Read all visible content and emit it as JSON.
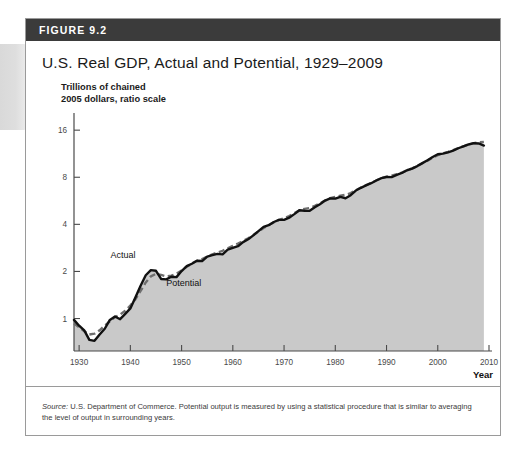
{
  "figure": {
    "number_label": "FIGURE 9.2",
    "title": "U.S. Real GDP, Actual and Potential, 1929–2009",
    "unit_caption_line1": "Trillions of chained",
    "unit_caption_line2": "2005 dollars, ratio scale",
    "source_prefix": "Source:",
    "source_text": " U.S. Department of Commerce. Potential output is measured by using a statistical procedure that is similar to averaging the level of output in surrounding years."
  },
  "colors": {
    "header_bar": "#3b3b3b",
    "actual_line": "#111111",
    "potential_line": "#6e6e6e",
    "area_fill": "#c9c9c9",
    "axis": "#4a4a4a",
    "border": "#9a9a9a"
  },
  "chart_data": {
    "type": "line",
    "title": "U.S. Real GDP, Actual and Potential, 1929–2009",
    "xlabel": "Year",
    "ylabel": "Trillions of chained 2005 dollars, ratio scale",
    "yscale": "log",
    "ylim": [
      0.62,
      20
    ],
    "xlim": [
      1929,
      2010
    ],
    "ytick_values": [
      1,
      2,
      4,
      8,
      16
    ],
    "ytick_labels": [
      "1",
      "2",
      "4",
      "8",
      "16"
    ],
    "xtick_values": [
      1930,
      1940,
      1950,
      1960,
      1970,
      1980,
      1990,
      2000,
      2010
    ],
    "xtick_labels": [
      "1930",
      "1940",
      "1950",
      "1960",
      "1970",
      "1980",
      "1990",
      "2000",
      "2010"
    ],
    "grid": false,
    "legend": "inline-annotations",
    "annotations": [
      {
        "text": "Actual",
        "x": 1941,
        "y": 2.45
      },
      {
        "text": "Potential",
        "x": 1947,
        "y": 1.62
      }
    ],
    "series": [
      {
        "name": "Actual",
        "style": "solid",
        "x": [
          1929,
          1930,
          1931,
          1932,
          1933,
          1934,
          1935,
          1936,
          1937,
          1938,
          1939,
          1940,
          1941,
          1942,
          1943,
          1944,
          1945,
          1946,
          1947,
          1948,
          1949,
          1950,
          1951,
          1952,
          1953,
          1954,
          1955,
          1956,
          1957,
          1958,
          1959,
          1960,
          1961,
          1962,
          1963,
          1964,
          1965,
          1966,
          1967,
          1968,
          1969,
          1970,
          1971,
          1972,
          1973,
          1974,
          1975,
          1976,
          1977,
          1978,
          1979,
          1980,
          1981,
          1982,
          1983,
          1984,
          1985,
          1986,
          1987,
          1988,
          1989,
          1990,
          1991,
          1992,
          1993,
          1994,
          1995,
          1996,
          1997,
          1998,
          1999,
          2000,
          2001,
          2002,
          2003,
          2004,
          2005,
          2006,
          2007,
          2008,
          2009
        ],
        "y": [
          0.98,
          0.9,
          0.84,
          0.73,
          0.72,
          0.79,
          0.86,
          0.98,
          1.03,
          0.99,
          1.07,
          1.16,
          1.37,
          1.62,
          1.89,
          2.04,
          2.02,
          1.79,
          1.78,
          1.85,
          1.84,
          2.01,
          2.16,
          2.24,
          2.34,
          2.33,
          2.49,
          2.54,
          2.59,
          2.57,
          2.76,
          2.83,
          2.9,
          3.08,
          3.21,
          3.4,
          3.62,
          3.85,
          3.95,
          4.14,
          4.27,
          4.27,
          4.41,
          4.65,
          4.92,
          4.89,
          4.88,
          5.14,
          5.38,
          5.68,
          5.86,
          5.84,
          5.99,
          5.87,
          6.14,
          6.58,
          6.85,
          7.09,
          7.33,
          7.63,
          7.9,
          8.03,
          8.02,
          8.29,
          8.52,
          8.87,
          9.09,
          9.43,
          9.85,
          10.28,
          10.78,
          11.22,
          11.33,
          11.54,
          11.84,
          12.26,
          12.62,
          12.96,
          13.21,
          13.16,
          12.76
        ]
      },
      {
        "name": "Potential",
        "style": "dashed",
        "x": [
          1929,
          1930,
          1931,
          1932,
          1933,
          1934,
          1935,
          1936,
          1937,
          1938,
          1939,
          1940,
          1941,
          1942,
          1943,
          1944,
          1945,
          1946,
          1947,
          1948,
          1949,
          1950,
          1951,
          1952,
          1953,
          1954,
          1955,
          1956,
          1957,
          1958,
          1959,
          1960,
          1961,
          1962,
          1963,
          1964,
          1965,
          1966,
          1967,
          1968,
          1969,
          1970,
          1971,
          1972,
          1973,
          1974,
          1975,
          1976,
          1977,
          1978,
          1979,
          1980,
          1981,
          1982,
          1983,
          1984,
          1985,
          1986,
          1987,
          1988,
          1989,
          1990,
          1991,
          1992,
          1993,
          1994,
          1995,
          1996,
          1997,
          1998,
          1999,
          2000,
          2001,
          2002,
          2003,
          2004,
          2005,
          2006,
          2007,
          2008,
          2009
        ],
        "y": [
          0.93,
          0.88,
          0.83,
          0.79,
          0.8,
          0.84,
          0.9,
          0.96,
          1.02,
          1.06,
          1.12,
          1.21,
          1.33,
          1.5,
          1.7,
          1.86,
          1.93,
          1.9,
          1.86,
          1.88,
          1.93,
          2.03,
          2.14,
          2.25,
          2.34,
          2.4,
          2.49,
          2.57,
          2.64,
          2.71,
          2.81,
          2.91,
          3.01,
          3.13,
          3.26,
          3.42,
          3.6,
          3.79,
          3.96,
          4.12,
          4.27,
          4.38,
          4.52,
          4.72,
          4.92,
          5.02,
          5.09,
          5.25,
          5.45,
          5.68,
          5.88,
          6.0,
          6.1,
          6.18,
          6.33,
          6.6,
          6.87,
          7.12,
          7.36,
          7.63,
          7.89,
          8.07,
          8.18,
          8.36,
          8.57,
          8.86,
          9.12,
          9.44,
          9.83,
          10.22,
          10.67,
          11.09,
          11.37,
          11.62,
          11.92,
          12.28,
          12.62,
          12.94,
          13.2,
          13.36,
          13.45
        ]
      }
    ]
  }
}
